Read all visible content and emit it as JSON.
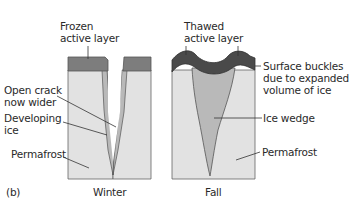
{
  "figure": {
    "panel_label": "(b)",
    "colors": {
      "permafrost": "#e2e2e2",
      "active_layer_frozen": "#7d7d7d",
      "active_layer_thawed": "#4a4a4a",
      "ice": "#b9b9b9",
      "outline": "#555555"
    }
  },
  "winter": {
    "caption": "Winter",
    "labels": {
      "frozen_line1": "Frozen",
      "frozen_line2": "active layer",
      "crack_line1": "Open crack",
      "crack_line2": "now wider",
      "developing_line1": "Developing",
      "developing_line2": "ice",
      "permafrost": "Permafrost"
    }
  },
  "fall": {
    "caption": "Fall",
    "labels": {
      "thawed_line1": "Thawed",
      "thawed_line2": "active layer",
      "buckles_line1": "Surface buckles",
      "buckles_line2": "due to expanded",
      "buckles_line3": "volume of ice",
      "ice_wedge": "Ice wedge",
      "permafrost": "Permafrost"
    }
  }
}
